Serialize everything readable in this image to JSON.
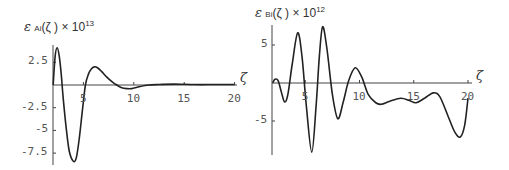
{
  "chart_data": [
    {
      "type": "line",
      "title": "",
      "ylabel": "εAi(ζ) × 10^13",
      "ylabel_parts": {
        "symbol": "ε",
        "sub": "Ai",
        "arg": "(ζ )",
        "times": "× 10",
        "exp": "13"
      },
      "xlabel": "ζ",
      "xlim": [
        2,
        20
      ],
      "ylim": [
        -8.6,
        4.2
      ],
      "xticks": [
        5,
        10,
        15,
        20
      ],
      "xtick_labels": [
        "5",
        "10",
        "15",
        "20"
      ],
      "yticks": [
        2.5,
        -2.5,
        -5,
        -7.5
      ],
      "ytick_labels": [
        "2.5",
        "-2.5",
        "-5",
        "-7.5"
      ],
      "grid": false,
      "legend": null,
      "series": [
        {
          "name": "εAi(ζ) × 10^13",
          "x": [
            2.0,
            2.2,
            2.4,
            2.6,
            2.8,
            3.0,
            3.3,
            3.6,
            4.0,
            4.3,
            4.6,
            4.9,
            5.2,
            5.5,
            5.8,
            6.1,
            6.4,
            6.8,
            7.3,
            7.8,
            8.3,
            8.8,
            9.3,
            9.8,
            10.5,
            11.5,
            12.5,
            14,
            16,
            18,
            20
          ],
          "y": [
            0.0,
            3.2,
            4.1,
            3.2,
            1.2,
            -1.5,
            -4.8,
            -7.3,
            -8.4,
            -8.0,
            -5.8,
            -2.8,
            0.0,
            1.2,
            1.8,
            2.0,
            1.9,
            1.5,
            0.9,
            0.4,
            0.0,
            -0.3,
            -0.4,
            -0.4,
            -0.2,
            0.0,
            0.05,
            0.1,
            0.05,
            0.05,
            0.05
          ]
        }
      ]
    },
    {
      "type": "line",
      "title": "",
      "ylabel": "εBi(ζ) × 10^12",
      "ylabel_parts": {
        "symbol": "ε",
        "sub": "Bi",
        "arg": "(ζ )",
        "times": "× 10",
        "exp": "12"
      },
      "xlabel": "ζ",
      "xlim": [
        2,
        20
      ],
      "ylim": [
        -9.2,
        7.6
      ],
      "xticks": [
        5,
        10,
        15,
        20
      ],
      "xtick_labels": [
        "5",
        "10",
        "15",
        "20"
      ],
      "yticks": [
        5,
        -5
      ],
      "ytick_labels": [
        "5",
        "-5"
      ],
      "grid": false,
      "legend": null,
      "series": [
        {
          "name": "εBi(ζ) × 10^12",
          "x": [
            2.0,
            2.2,
            2.5,
            2.8,
            3.1,
            3.4,
            3.8,
            4.3,
            4.7,
            5.1,
            5.6,
            6.0,
            6.3,
            6.6,
            7.0,
            7.5,
            8.0,
            8.5,
            9.0,
            9.6,
            10.2,
            10.8,
            11.5,
            12.0,
            12.8,
            13.8,
            14.6,
            15.2,
            16.0,
            16.8,
            17.4,
            18.2,
            18.8,
            19.3,
            19.7,
            20.0
          ],
          "y": [
            0.0,
            0.5,
            0.3,
            -1.2,
            -2.5,
            -1.5,
            2.5,
            6.6,
            3.5,
            -3.0,
            -9.1,
            -3.0,
            3.5,
            7.4,
            4.5,
            -1.5,
            -4.7,
            -2.5,
            0.3,
            2.0,
            0.8,
            -1.5,
            -2.6,
            -2.8,
            -2.4,
            -2.0,
            -2.3,
            -2.6,
            -2.0,
            -1.3,
            -1.8,
            -4.5,
            -6.5,
            -7.1,
            -5.5,
            -2.0
          ]
        }
      ]
    }
  ],
  "panels": [
    {
      "label": {
        "symbol": "ε",
        "sub": "Ai",
        "arg": "(ζ )",
        "times": "× 10",
        "exp": "13"
      },
      "xvar": "ζ",
      "xtick_labels": [
        "5",
        "10",
        "15",
        "20"
      ],
      "ytick_labels": [
        "2.5",
        "-2.5",
        "-5",
        "-7.5"
      ]
    },
    {
      "label": {
        "symbol": "ε",
        "sub": "Bi",
        "arg": "(ζ )",
        "times": "× 10",
        "exp": "12"
      },
      "xvar": "ζ",
      "xtick_labels": [
        "5",
        "10",
        "15",
        "20"
      ],
      "ytick_labels": [
        "5",
        "-5"
      ]
    }
  ]
}
